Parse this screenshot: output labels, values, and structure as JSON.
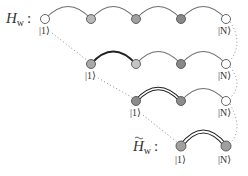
{
  "labels": {
    "hw": "H",
    "hw_sub": "w",
    "hw_colon": ":",
    "hw_tilde": "H",
    "hw_tilde_sub": "w",
    "hw_tilde_colon": ":",
    "ket_first": "|1⟩",
    "ket_last": "|N⟩"
  },
  "rows": [
    {
      "name": "row-1-full-chain",
      "nodes": [
        {
          "x": 45,
          "fill": "#ffffff"
        },
        {
          "x": 91,
          "fill": "#b8b8b8"
        },
        {
          "x": 136,
          "fill": "#a0a0a0"
        },
        {
          "x": 181,
          "fill": "#888888"
        },
        {
          "x": 226,
          "fill": "#ffffff"
        }
      ],
      "y": 19
    },
    {
      "name": "row-2",
      "nodes": [
        {
          "x": 91,
          "fill": "#a8a8a8"
        },
        {
          "x": 136,
          "fill": "#c4c4c4"
        },
        {
          "x": 181,
          "fill": "#888888"
        },
        {
          "x": 226,
          "fill": "#ffffff"
        }
      ],
      "y": 64
    },
    {
      "name": "row-3",
      "nodes": [
        {
          "x": 136,
          "fill": "#8c8c8c"
        },
        {
          "x": 181,
          "fill": "#8c8c8c"
        },
        {
          "x": 226,
          "fill": "#ffffff"
        }
      ],
      "y": 101
    },
    {
      "name": "row-4-effective",
      "nodes": [
        {
          "x": 181,
          "fill": "#a0a0a0"
        },
        {
          "x": 226,
          "fill": "#a0a0a0"
        }
      ],
      "y": 146
    }
  ],
  "colors": {
    "arc": "#6e6e6e",
    "arc_bold": "#222222",
    "node_stroke": "#555555",
    "dots": "#8a8a8a"
  }
}
